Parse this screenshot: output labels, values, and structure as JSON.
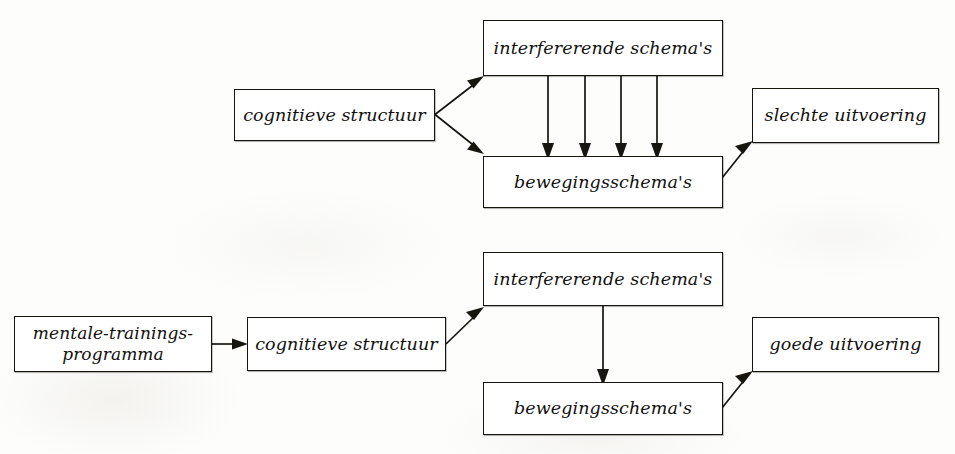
{
  "figure": {
    "kind": "flow-diagram",
    "language": "nl",
    "background_color": "#fdfdfb",
    "ink_color": "#17150f",
    "panels": [
      {
        "id": "top-panel",
        "name": "zonder-mentale-training",
        "outcome": "slechte uitvoering"
      },
      {
        "id": "bottom-panel",
        "name": "met-mentale-training",
        "outcome": "goede uitvoering"
      }
    ]
  },
  "top": {
    "cognitieve_structuur": "cognitieve structuur",
    "interfererende_schemas": "interfererende schema's",
    "bewegingsschemas": "bewegingsschema's",
    "uitvoering": "slechte uitvoering",
    "interference_arrow_count": 4
  },
  "bottom": {
    "mentale_trainingsprogramma": "mentale-trainings-\nprogramma",
    "cognitieve_structuur": "cognitieve structuur",
    "interfererende_schemas": "interfererende schema's",
    "bewegingsschemas": "bewegingsschema's",
    "uitvoering": "goede uitvoering",
    "interference_arrow_count": 1
  },
  "edges": {
    "top": [
      {
        "from": "cognitieve structuur",
        "to": "interfererende schema's"
      },
      {
        "from": "cognitieve structuur",
        "to": "bewegingsschema's"
      },
      {
        "from": "interfererende schema's",
        "to": "bewegingsschema's"
      },
      {
        "from": "interfererende schema's",
        "to": "bewegingsschema's"
      },
      {
        "from": "interfererende schema's",
        "to": "bewegingsschema's"
      },
      {
        "from": "interfererende schema's",
        "to": "bewegingsschema's"
      },
      {
        "from": "bewegingsschema's",
        "to": "slechte uitvoering"
      }
    ],
    "bottom": [
      {
        "from": "mentale-trainings-programma",
        "to": "cognitieve structuur"
      },
      {
        "from": "cognitieve structuur",
        "to": "interfererende schema's"
      },
      {
        "from": "interfererende schema's",
        "to": "bewegingsschema's"
      },
      {
        "from": "bewegingsschema's",
        "to": "goede uitvoering"
      }
    ]
  }
}
